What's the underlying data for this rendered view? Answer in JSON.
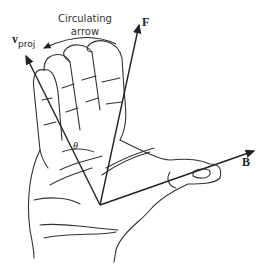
{
  "diagram": {
    "labels": {
      "circulating_line1": "Circulating",
      "circulating_line2": "arrow",
      "force": "F",
      "velocity_main": "v",
      "velocity_sub": "proj",
      "field": "B",
      "angle": "θ"
    },
    "vectors": [
      {
        "name": "F",
        "from": [
          100,
          205
        ],
        "to": [
          140,
          22
        ]
      },
      {
        "name": "v_proj",
        "from": [
          100,
          205
        ],
        "to": [
          25,
          52
        ]
      },
      {
        "name": "B",
        "from": [
          100,
          205
        ],
        "to": [
          257,
          150
        ]
      }
    ],
    "colors": {
      "ink": "#222222",
      "background": "#ffffff"
    }
  }
}
